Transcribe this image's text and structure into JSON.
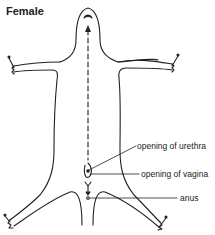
{
  "title": "Female",
  "labels": {
    "urethra": "opening of urethra",
    "vagina": "opening of vagina",
    "anus": "anus"
  },
  "colors": {
    "line": "#222222",
    "background": "#ffffff"
  }
}
